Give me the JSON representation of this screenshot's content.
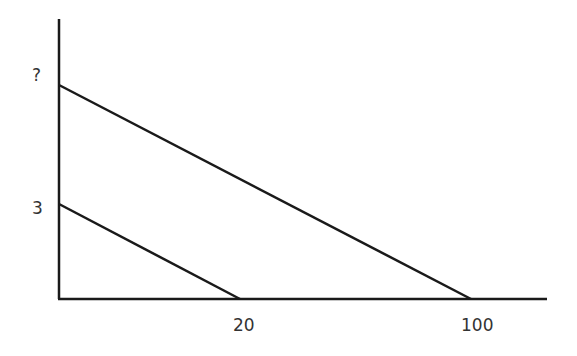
{
  "diagram": {
    "type": "line-graph",
    "y_axis_labels": [
      {
        "text": "?",
        "y_pixel": 85
      },
      {
        "text": "3",
        "y_pixel": 204
      }
    ],
    "x_axis_labels": [
      {
        "text": "20",
        "x_pixel": 240
      },
      {
        "text": "100",
        "x_pixel": 471
      }
    ],
    "lines": [
      {
        "name": "outer-line",
        "from": {
          "x": 0,
          "y": "?"
        },
        "to": {
          "x": 100,
          "y": 0
        }
      },
      {
        "name": "inner-line",
        "from": {
          "x": 0,
          "y": 3
        },
        "to": {
          "x": 20,
          "y": 0
        }
      }
    ],
    "stroke_color": "#1a1a1a"
  }
}
